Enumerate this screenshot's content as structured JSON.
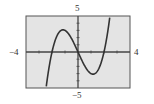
{
  "chart_data": {
    "type": "line",
    "title": "",
    "xlabel": "",
    "ylabel": "",
    "xlim": [
      -4,
      4
    ],
    "ylim": [
      -5,
      5
    ],
    "x_tick_step": 1,
    "y_tick_step": 1,
    "grid": false,
    "function": "x^3 - 4x",
    "series": [
      {
        "name": "f(x)",
        "x": [
          -2.4,
          -2.2,
          -2,
          -1.8,
          -1.6,
          -1.4,
          -1.2,
          -1.0,
          -0.8,
          -0.6,
          -0.4,
          -0.2,
          0,
          0.2,
          0.4,
          0.6,
          0.8,
          1.0,
          1.2,
          1.4,
          1.6,
          1.8,
          2.0,
          2.2,
          2.4
        ],
        "y": [
          -4.22,
          -1.85,
          0,
          1.37,
          2.3,
          2.86,
          3.07,
          3.0,
          2.69,
          2.18,
          1.54,
          0.79,
          0,
          -0.79,
          -1.54,
          -2.18,
          -2.69,
          -3.0,
          -3.07,
          -2.86,
          -2.3,
          -1.37,
          0,
          1.85,
          4.22
        ]
      }
    ],
    "labels": {
      "xmin": "−4",
      "xmax": "4",
      "ymax": "5",
      "ymin": "−5"
    },
    "colors": {
      "background": "#e4e4e4",
      "curve": "#333333",
      "axis": "#444444"
    }
  }
}
